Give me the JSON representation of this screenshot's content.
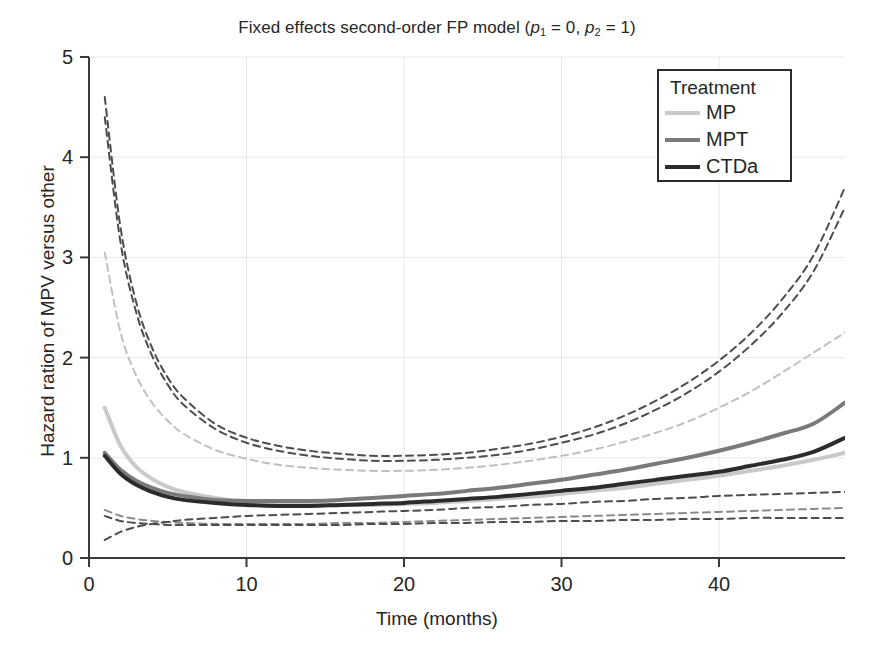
{
  "chart_data": {
    "type": "line",
    "title": "Fixed effects second-order FP model (p1 = 0, p2 = 1)",
    "title_parts": {
      "lead": "Fixed effects second-order FP model (",
      "p1_sym": "p",
      "p1_sub": "1",
      "p1_eq": " = 0, ",
      "p2_sym": "p",
      "p2_sub": "2",
      "p2_eq": " = 1)"
    },
    "xlabel": "Time (months)",
    "ylabel": "Hazard ration of MPV versus other",
    "xlim": [
      0,
      48
    ],
    "ylim": [
      0,
      5
    ],
    "xticks": [
      0,
      10,
      20,
      30,
      40
    ],
    "xticklabels": [
      "0",
      "10",
      "20",
      "30",
      "40"
    ],
    "yticks": [
      0,
      1,
      2,
      3,
      4,
      5
    ],
    "yticklabels": [
      "0",
      "1",
      "2",
      "3",
      "4",
      "5"
    ],
    "grid": true,
    "grid_color": "#e8e8e8",
    "axis_color": "#3a3a3a",
    "background": "#ffffff",
    "legend": {
      "title": "Treatment",
      "position": "top-right",
      "entries": [
        {
          "label": "MP",
          "color": "#c9c9c9",
          "width": 4
        },
        {
          "label": "MPT",
          "color": "#7a7a7a",
          "width": 4
        },
        {
          "label": "CTDa",
          "color": "#2b2b2b",
          "width": 4
        }
      ]
    },
    "x": [
      1,
      2,
      3,
      4,
      5,
      6,
      8,
      10,
      12,
      14,
      16,
      18,
      20,
      22,
      24,
      26,
      28,
      30,
      32,
      34,
      36,
      38,
      40,
      42,
      44,
      46,
      48
    ],
    "series": [
      {
        "name": "MP",
        "role": "estimate",
        "color": "#c9c9c9",
        "style": "solid",
        "width": 4,
        "values": [
          1.5,
          1.12,
          0.91,
          0.79,
          0.71,
          0.66,
          0.6,
          0.56,
          0.54,
          0.53,
          0.53,
          0.53,
          0.54,
          0.55,
          0.57,
          0.59,
          0.61,
          0.64,
          0.67,
          0.7,
          0.74,
          0.78,
          0.82,
          0.87,
          0.92,
          0.98,
          1.05
        ]
      },
      {
        "name": "MPT",
        "role": "estimate",
        "color": "#7a7a7a",
        "style": "solid",
        "width": 4,
        "values": [
          1.05,
          0.88,
          0.77,
          0.7,
          0.65,
          0.62,
          0.58,
          0.57,
          0.57,
          0.57,
          0.58,
          0.6,
          0.62,
          0.64,
          0.67,
          0.7,
          0.74,
          0.78,
          0.83,
          0.88,
          0.94,
          1.0,
          1.07,
          1.15,
          1.24,
          1.34,
          1.55
        ]
      },
      {
        "name": "CTDa",
        "role": "estimate",
        "color": "#2b2b2b",
        "style": "solid",
        "width": 4,
        "values": [
          1.02,
          0.84,
          0.73,
          0.66,
          0.61,
          0.58,
          0.55,
          0.53,
          0.52,
          0.52,
          0.53,
          0.54,
          0.55,
          0.57,
          0.59,
          0.61,
          0.64,
          0.67,
          0.7,
          0.74,
          0.78,
          0.82,
          0.86,
          0.92,
          0.98,
          1.06,
          1.2
        ]
      },
      {
        "name": "MPT upper CI",
        "role": "ci-upper",
        "color": "#4d4d4d",
        "style": "dashed",
        "width": 2,
        "values": [
          4.6,
          3.3,
          2.55,
          2.1,
          1.8,
          1.6,
          1.34,
          1.2,
          1.12,
          1.07,
          1.04,
          1.02,
          1.02,
          1.03,
          1.05,
          1.09,
          1.14,
          1.21,
          1.3,
          1.42,
          1.57,
          1.75,
          1.97,
          2.24,
          2.58,
          3.02,
          3.7
        ]
      },
      {
        "name": "CTDa upper CI",
        "role": "ci-upper",
        "color": "#4d4d4d",
        "style": "dashed",
        "width": 2,
        "values": [
          4.4,
          3.15,
          2.45,
          2.02,
          1.73,
          1.53,
          1.29,
          1.15,
          1.07,
          1.02,
          0.99,
          0.97,
          0.97,
          0.98,
          1.0,
          1.03,
          1.08,
          1.15,
          1.23,
          1.34,
          1.48,
          1.65,
          1.86,
          2.12,
          2.44,
          2.86,
          3.5
        ]
      },
      {
        "name": "MP upper CI",
        "role": "ci-upper",
        "color": "#c0c0c0",
        "style": "dashed",
        "width": 2,
        "values": [
          3.05,
          2.25,
          1.82,
          1.55,
          1.37,
          1.24,
          1.08,
          0.99,
          0.93,
          0.9,
          0.88,
          0.87,
          0.87,
          0.88,
          0.9,
          0.93,
          0.97,
          1.02,
          1.08,
          1.16,
          1.25,
          1.36,
          1.5,
          1.66,
          1.85,
          2.05,
          2.25
        ]
      },
      {
        "name": "MP lower CI",
        "role": "ci-lower",
        "color": "#8a8a8a",
        "style": "dashed",
        "width": 2,
        "values": [
          0.48,
          0.42,
          0.39,
          0.37,
          0.36,
          0.35,
          0.34,
          0.34,
          0.34,
          0.34,
          0.35,
          0.35,
          0.36,
          0.37,
          0.38,
          0.39,
          0.4,
          0.41,
          0.42,
          0.43,
          0.44,
          0.45,
          0.46,
          0.47,
          0.48,
          0.49,
          0.5
        ]
      },
      {
        "name": "CTDa lower CI",
        "role": "ci-lower",
        "color": "#4d4d4d",
        "style": "dashed",
        "width": 2,
        "values": [
          0.42,
          0.37,
          0.35,
          0.34,
          0.33,
          0.33,
          0.33,
          0.33,
          0.33,
          0.33,
          0.33,
          0.34,
          0.34,
          0.35,
          0.35,
          0.36,
          0.36,
          0.37,
          0.37,
          0.38,
          0.38,
          0.39,
          0.39,
          0.4,
          0.4,
          0.4,
          0.4
        ]
      },
      {
        "name": "MPT lower CI",
        "role": "ci-lower",
        "color": "#4d4d4d",
        "style": "dashed",
        "width": 2,
        "values": [
          0.18,
          0.26,
          0.31,
          0.34,
          0.36,
          0.38,
          0.4,
          0.42,
          0.43,
          0.44,
          0.45,
          0.46,
          0.47,
          0.48,
          0.5,
          0.51,
          0.53,
          0.54,
          0.56,
          0.57,
          0.59,
          0.6,
          0.62,
          0.63,
          0.64,
          0.65,
          0.66
        ]
      }
    ]
  }
}
